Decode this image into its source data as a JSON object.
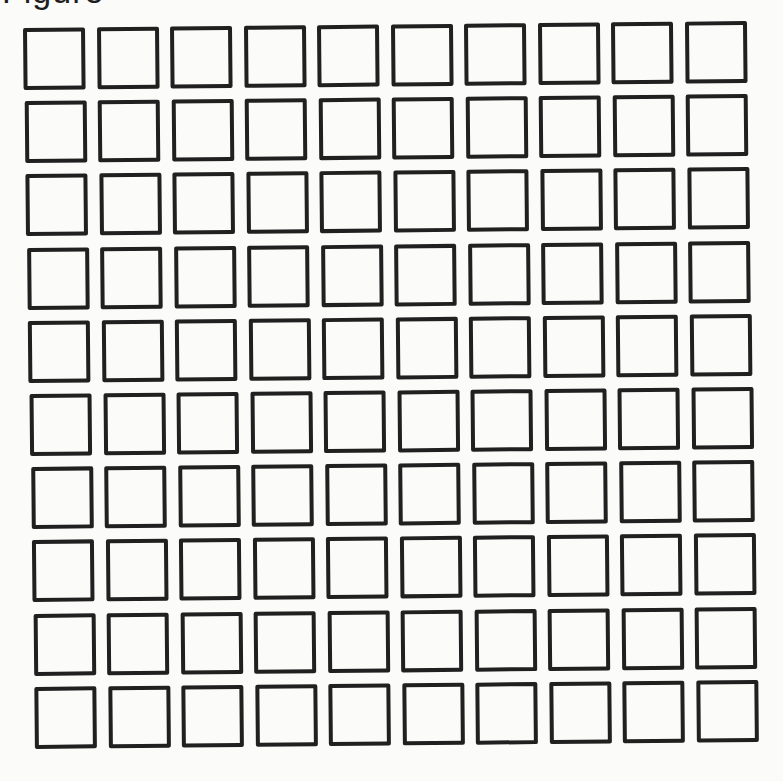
{
  "page": {
    "header_text": "Figure"
  },
  "grid": {
    "rows": 10,
    "columns": 10,
    "cell_state": "empty",
    "cell_border_color": "#202020",
    "background_color": "#fbfbfa",
    "origin_x": 0,
    "origin_y": 0,
    "pitch_x": 73.5,
    "pitch_y": 73.2,
    "skew_x_per_row": 0.6,
    "cells": [
      [
        "",
        "",
        "",
        "",
        "",
        "",
        "",
        "",
        "",
        ""
      ],
      [
        "",
        "",
        "",
        "",
        "",
        "",
        "",
        "",
        "",
        ""
      ],
      [
        "",
        "",
        "",
        "",
        "",
        "",
        "",
        "",
        "",
        ""
      ],
      [
        "",
        "",
        "",
        "",
        "",
        "",
        "",
        "",
        "",
        ""
      ],
      [
        "",
        "",
        "",
        "",
        "",
        "",
        "",
        "",
        "",
        ""
      ],
      [
        "",
        "",
        "",
        "",
        "",
        "",
        "",
        "",
        "",
        ""
      ],
      [
        "",
        "",
        "",
        "",
        "",
        "",
        "",
        "",
        "",
        ""
      ],
      [
        "",
        "",
        "",
        "",
        "",
        "",
        "",
        "",
        "",
        ""
      ],
      [
        "",
        "",
        "",
        "",
        "",
        "",
        "",
        "",
        "",
        ""
      ],
      [
        "",
        "",
        "",
        "",
        "",
        "",
        "",
        "",
        "",
        ""
      ]
    ]
  }
}
